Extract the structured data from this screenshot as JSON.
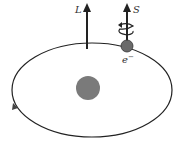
{
  "diagram": {
    "labels": {
      "orbital_angular_momentum": "L",
      "spin": "S",
      "electron": "e",
      "electron_charge": "−"
    },
    "colors": {
      "line": "#222222",
      "nucleus": "#7a7a7a",
      "electron": "#6a6a6a",
      "background": "#ffffff"
    }
  }
}
